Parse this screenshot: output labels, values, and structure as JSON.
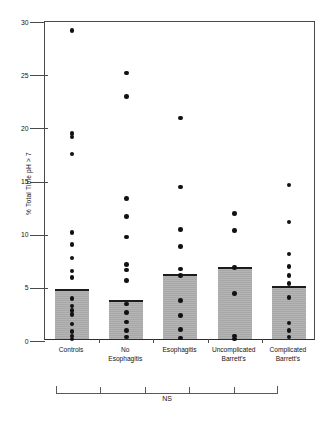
{
  "chart_data": {
    "type": "scatter",
    "title": "",
    "subtitle": "",
    "xlabel": "",
    "ylabel": "% Total Time pH > 7",
    "ylim": [
      0,
      30
    ],
    "yticks": [
      0,
      5,
      10,
      15,
      20,
      25,
      30
    ],
    "ytick_labels": [
      "0",
      "5",
      "10",
      "15",
      "20",
      "25",
      "30"
    ],
    "grid": false,
    "legend": null,
    "legend_position": "none",
    "bar_summary_statistic": "mean",
    "categories": [
      "Controls",
      "No Esophagitis",
      "Esophagitis",
      "Uncomplicated Barrett's",
      "Complicated Barrett's"
    ],
    "category_label_lines": [
      [
        "Controls"
      ],
      [
        "No",
        "Esophagitis"
      ],
      [
        "Esophagitis"
      ],
      [
        "Uncomplicated",
        "Barrett's"
      ],
      [
        "Complicated",
        "Barrett's"
      ]
    ],
    "values": [
      4.5,
      3.5,
      5.9,
      6.6,
      4.8
    ],
    "series": [
      {
        "name": "Controls",
        "mean": 4.5,
        "points": [
          29.0,
          19.3,
          19.0,
          17.4,
          10.0,
          8.9,
          7.6,
          6.4,
          5.8,
          3.8,
          3.1,
          2.7,
          2.3,
          1.4,
          0.7,
          0.3,
          0.0
        ]
      },
      {
        "name": "No Esophagitis",
        "mean": 3.5,
        "points": [
          25.0,
          22.8,
          13.2,
          11.5,
          9.6,
          7.0,
          6.5,
          5.5,
          3.3,
          2.5,
          1.6,
          0.8,
          0.2
        ]
      },
      {
        "name": "Esophagitis",
        "mean": 5.9,
        "points": [
          20.8,
          14.3,
          10.3,
          8.7,
          6.6,
          6.0,
          3.6,
          2.2,
          0.9,
          0.1
        ]
      },
      {
        "name": "Uncomplicated Barrett's",
        "mean": 6.6,
        "points": [
          11.8,
          10.2,
          6.7,
          4.3,
          0.3,
          0.0
        ]
      },
      {
        "name": "Complicated Barrett's",
        "mean": 4.8,
        "points": [
          14.5,
          11.0,
          8.0,
          6.8,
          6.0,
          5.2,
          3.9,
          1.5,
          0.8,
          0.2
        ]
      }
    ],
    "annotations": [
      {
        "name": "significance-bracket",
        "label": "NS",
        "spans_categories": [
          0,
          4
        ],
        "meaning": "not significant"
      }
    ],
    "colors": {
      "bar_fill": "#aeaeae",
      "bar_top": "#1b1b1b",
      "point": "#111111",
      "axis": "#4a4a4a",
      "text": "#141414"
    }
  },
  "caption": ""
}
